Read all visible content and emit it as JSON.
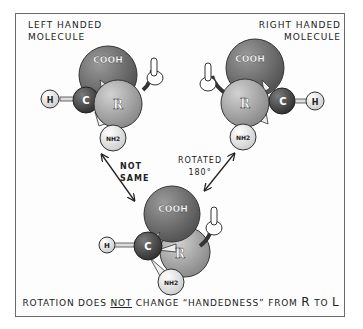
{
  "labels": {
    "left_title_line1": "Left Handed",
    "left_title_line2": "Molecule",
    "right_title_line1": "Right Handed",
    "right_title_line2": "Molecule",
    "not_same_line1": "Not",
    "not_same_line2": "Same",
    "rotated_line1": "Rotated",
    "rotated_line2": "180°"
  },
  "caption": {
    "part1": "Rotation does ",
    "emphasis": "not",
    "part2": " change “Handedness” from ",
    "r": "R",
    "to": " to ",
    "l": "L"
  },
  "atoms": {
    "carboxyl": "COOH",
    "r_group": "R",
    "carbon": "C",
    "hydrogen": "H",
    "amine": "NH2"
  },
  "colors": {
    "cooh": "#6e6e6e",
    "r_group": "#a8a8a8",
    "carbon": "#4a4a4a",
    "hydrogen": "#efefef",
    "amine": "#f2f2f2",
    "frame": "#6a6a6a",
    "ink": "#222222"
  }
}
